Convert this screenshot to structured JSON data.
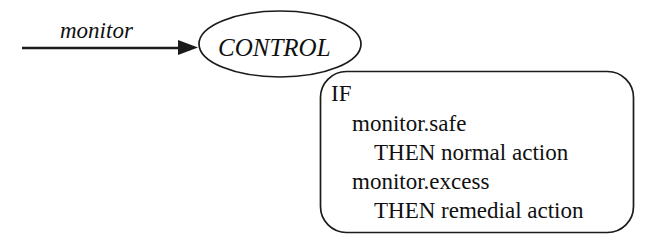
{
  "diagram": {
    "background_color": "#ffffff",
    "stroke_color": "#1b1b1b",
    "text_color": "#101010",
    "edges": [
      {
        "id": "monitor-edge",
        "label": "monitor",
        "from": "input",
        "to": "control-node",
        "style": "solid-arrow"
      }
    ],
    "nodes": [
      {
        "id": "control-node",
        "shape": "ellipse",
        "label": "CONTROL"
      }
    ],
    "rule_box": {
      "id": "rule-box",
      "shape": "rounded-rectangle",
      "lines": [
        {
          "text": "IF",
          "indent": 0
        },
        {
          "text": "monitor.safe",
          "indent": 1
        },
        {
          "text": "THEN normal action",
          "indent": 2
        },
        {
          "text": "monitor.excess",
          "indent": 1
        },
        {
          "text": "THEN remedial action",
          "indent": 2
        }
      ]
    }
  }
}
